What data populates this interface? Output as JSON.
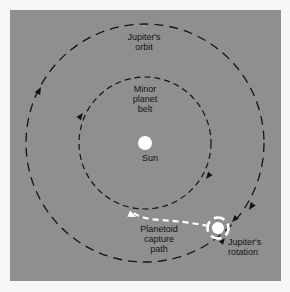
{
  "figure": {
    "type": "astronomy-orbit-diagram",
    "background_color": "#f7f7f7",
    "panel_color": "#8f8f8f",
    "stroke_color": "#141414",
    "highlight_color": "#ffffff",
    "labels": {
      "jupiters_orbit": "Jupiter's\norbit",
      "minor_planet_belt": "Minor\nplanet\nbelt",
      "sun": "Sun",
      "planetoid_capture_path": "Planetoid\ncapture\npath",
      "jupiters_rotation": "Jupiter's\nrotation"
    },
    "icons": {
      "sun": "sun-body",
      "jupiter": "jupiter-body",
      "jupiter_rotation_ring": "rotation-ring-icon",
      "orbit_direction_arrow": "arrowhead-icon",
      "capture_path_arrow": "arrowhead-icon"
    },
    "geometry": {
      "center": {
        "x": 135,
        "y": 133
      },
      "jupiter_orbit_radius": 119,
      "minor_planet_belt_radius": 66,
      "sun_radius": 7,
      "jupiter_position": {
        "x": 208,
        "y": 218
      },
      "jupiter_radius": 6,
      "jupiter_ring_radius": 11
    }
  }
}
